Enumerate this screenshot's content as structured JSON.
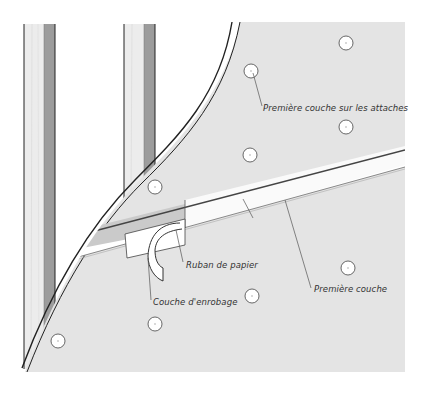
{
  "diagram": {
    "title": "",
    "colors": {
      "board": "#e6e6e6",
      "board_edge": "#222222",
      "stud_light": "#eaeaea",
      "stud_dark": "#9a9a9a",
      "tape": "#ffffff",
      "compound": "#cfcfcf",
      "fastener": "#ffffff",
      "leader": "#555555",
      "text": "#333333"
    },
    "components": [
      {
        "id": "stud-left",
        "label": "Montant (gauche)"
      },
      {
        "id": "stud-right",
        "label": "Montant (droite)"
      },
      {
        "id": "drywall-panel",
        "label": "Panneau de placoplâtre"
      },
      {
        "id": "joint-strip",
        "label": "Joint"
      },
      {
        "id": "trowel",
        "label": "Couteau"
      },
      {
        "id": "fasteners",
        "count": 8
      }
    ],
    "labels": [
      {
        "id": "fasteners-first-coat",
        "text": "Première couche sur les attaches"
      },
      {
        "id": "paper-tape",
        "text": "Ruban de papier"
      },
      {
        "id": "first-coat",
        "text": "Première couche"
      },
      {
        "id": "embedding-coat",
        "text": "Couche d'enrobage"
      }
    ]
  }
}
